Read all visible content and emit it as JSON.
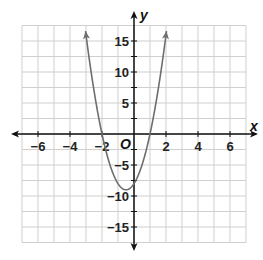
{
  "chart_data": {
    "type": "line",
    "title": "",
    "xlabel": "x",
    "ylabel": "y",
    "origin_label": "O",
    "xlim": [
      -7,
      7
    ],
    "ylim": [
      -17.5,
      17.5
    ],
    "grid": true,
    "grid_step_x": 1,
    "grid_step_y": 2.5,
    "x_ticks": [
      -6,
      -4,
      -2,
      2,
      4,
      6
    ],
    "x_tick_labels": [
      "−6",
      "−4",
      "−2",
      "2",
      "4",
      "6"
    ],
    "y_ticks": [
      15,
      10,
      5,
      -5,
      -10,
      -15
    ],
    "y_tick_labels": [
      "15",
      "10",
      "5",
      "−5",
      "−10",
      "−15"
    ],
    "series": [
      {
        "name": "parabola",
        "equation": "y = 4x^2 + 4x - 8",
        "vertex": [
          -0.5,
          -9
        ],
        "roots": [
          -2,
          1
        ],
        "y_intercept": -8,
        "x_range": [
          -3.03,
          2.03
        ],
        "arrows": "both ends",
        "x": [
          -3,
          -2.5,
          -2,
          -1.5,
          -1,
          -0.5,
          0,
          0.5,
          1,
          1.5,
          2
        ],
        "y": [
          16,
          7,
          0,
          -5,
          -8,
          -9,
          -8,
          -5,
          0,
          7,
          16
        ]
      }
    ],
    "legend": "none"
  },
  "colors": {
    "grid": "#cfcfcf",
    "axes": "#111111",
    "curve": "#6e6e6e",
    "background": "#ffffff"
  }
}
